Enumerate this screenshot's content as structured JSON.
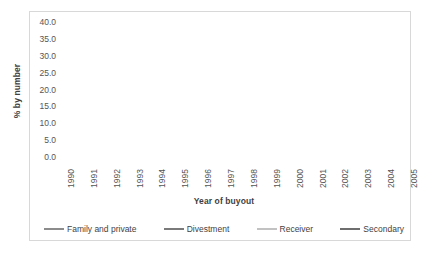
{
  "chart_data": {
    "type": "line",
    "title": "",
    "xlabel": "Year of buyout",
    "ylabel": "% by number",
    "ylim": [
      0,
      40
    ],
    "ytick_step": 5,
    "grid": true,
    "legend_position": "bottom",
    "categories": [
      "1990",
      "1991",
      "1992",
      "1993",
      "1994",
      "1995",
      "1996",
      "1997",
      "1998",
      "1999",
      "2000",
      "2001",
      "2002",
      "2003",
      "2004",
      "2005"
    ],
    "yticks": [
      "0.0",
      "5.0",
      "10.0",
      "15.0",
      "20.0",
      "25.0",
      "30.0",
      "35.0",
      "40.0"
    ],
    "series": [
      {
        "name": "Family and private",
        "color": "#8c8c8c",
        "width": 1.6,
        "values": [
          19.0,
          20.0,
          16.5,
          13.0,
          15.5,
          15.0,
          15.0,
          14.5,
          14.0,
          13.0,
          16.5,
          13.5,
          17.0,
          15.5,
          13.5,
          15.0
        ]
      },
      {
        "name": "Divestment",
        "color": "#7a7a7a",
        "width": 1.6,
        "values": [
          21.8,
          20.5,
          16.0,
          12.5,
          15.0,
          18.0,
          18.0,
          16.0,
          30.0,
          22.5,
          30.0,
          33.0,
          24.0,
          14.5,
          16.0,
          14.5
        ]
      },
      {
        "name": "Receiver",
        "color": "#c2c2c2",
        "width": 1.6,
        "values": [
          21.0,
          22.0,
          18.5,
          11.0,
          12.5,
          13.0,
          15.0,
          36.5,
          23.0,
          14.0,
          20.5,
          25.0,
          25.5,
          16.5,
          14.0,
          14.0
        ]
      },
      {
        "name": "Secondary",
        "color": "#6e6e6e",
        "width": 1.6,
        "values": [
          0.0,
          0.0,
          14.5,
          0.0,
          30.0,
          0.0,
          14.0,
          15.5,
          16.0,
          16.0,
          10.0,
          13.0,
          12.5,
          8.0,
          14.5,
          25.0
        ]
      }
    ]
  }
}
